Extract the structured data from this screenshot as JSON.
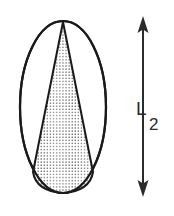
{
  "figure": {
    "background_color": "#ffffff",
    "stroke_color": "#1a1a1a",
    "stipple_color": "#3a3a3a",
    "label_color": "#2b2b2b",
    "outer_shape": {
      "name": "ellipse",
      "center_x": 63,
      "center_y": 107,
      "radius_x": 43,
      "radius_y": 86,
      "fill": "#ffffff",
      "stroke_width": 2.2
    },
    "inner_shape": {
      "name": "cone",
      "fill_pattern": "stipple-dots",
      "apex_x": 63,
      "apex_y": 22,
      "base_left_x": 33,
      "base_right_x": 93,
      "base_y": 173,
      "stroke_width": 2.0
    },
    "dimension": {
      "name": "dimension-arrow",
      "orientation": "vertical",
      "double_headed": true,
      "line_x": 143,
      "top_y": 17,
      "bottom_y": 196,
      "stroke_width": 2.0,
      "arrowhead_width": 11,
      "arrowhead_height": 16,
      "label_main": "L",
      "label_sub": "2",
      "label_main_x": 137,
      "label_main_y": 114,
      "label_sub_x": 150,
      "label_sub_y": 128
    }
  }
}
